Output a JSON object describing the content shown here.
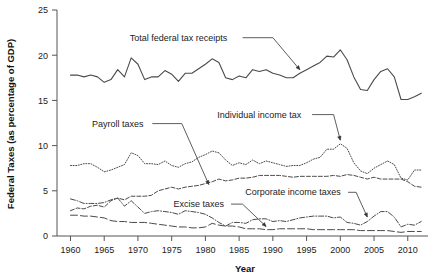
{
  "chart_data": {
    "type": "line",
    "title": "",
    "xlabel": "Year",
    "ylabel": "Federal Taxes (as percentage of GDP)",
    "xlim": [
      1958,
      2013
    ],
    "ylim": [
      0,
      25
    ],
    "xticks": [
      1960,
      1965,
      1970,
      1975,
      1980,
      1985,
      1990,
      1995,
      2000,
      2005,
      2010
    ],
    "yticks": [
      0,
      5,
      10,
      15,
      20,
      25
    ],
    "grid": false,
    "legend_position": "inline-annotations",
    "x": [
      1960,
      1961,
      1962,
      1963,
      1964,
      1965,
      1966,
      1967,
      1968,
      1969,
      1970,
      1971,
      1972,
      1973,
      1974,
      1975,
      1976,
      1977,
      1978,
      1979,
      1980,
      1981,
      1982,
      1983,
      1984,
      1985,
      1986,
      1987,
      1988,
      1989,
      1990,
      1991,
      1992,
      1993,
      1994,
      1995,
      1996,
      1997,
      1998,
      1999,
      2000,
      2001,
      2002,
      2003,
      2004,
      2005,
      2006,
      2007,
      2008,
      2009,
      2010,
      2011,
      2012
    ],
    "series": [
      {
        "name": "Total federal tax receipts",
        "style": "solid",
        "values": [
          17.8,
          17.8,
          17.6,
          17.8,
          17.6,
          17.0,
          17.3,
          18.4,
          17.6,
          19.7,
          19.0,
          17.3,
          17.6,
          17.6,
          18.3,
          17.9,
          17.1,
          18.0,
          18.0,
          18.5,
          19.0,
          19.6,
          19.2,
          17.5,
          17.3,
          17.7,
          17.5,
          18.4,
          18.2,
          18.4,
          18.0,
          17.8,
          17.5,
          17.5,
          18.0,
          18.4,
          18.8,
          19.2,
          19.9,
          19.8,
          20.6,
          19.5,
          17.6,
          16.2,
          16.1,
          17.3,
          18.2,
          18.5,
          17.6,
          15.1,
          15.1,
          15.4,
          15.8
        ]
      },
      {
        "name": "Individual income tax",
        "style": "dotted",
        "values": [
          7.8,
          7.8,
          8.0,
          8.0,
          7.6,
          7.1,
          7.3,
          7.6,
          7.9,
          9.2,
          8.9,
          8.0,
          8.0,
          7.9,
          8.3,
          7.8,
          7.6,
          8.0,
          8.2,
          8.7,
          9.0,
          9.4,
          9.2,
          8.4,
          7.8,
          8.1,
          7.9,
          8.4,
          8.0,
          8.3,
          8.1,
          7.9,
          7.7,
          7.8,
          7.8,
          8.1,
          8.5,
          8.7,
          9.6,
          9.6,
          10.2,
          9.7,
          8.1,
          7.2,
          6.9,
          7.5,
          7.9,
          8.3,
          7.9,
          6.4,
          6.2,
          7.3,
          7.3
        ]
      },
      {
        "name": "Payroll taxes",
        "style": "dashed",
        "values": [
          2.8,
          3.1,
          3.0,
          3.3,
          3.4,
          3.2,
          3.9,
          4.2,
          4.0,
          4.4,
          4.4,
          4.4,
          4.5,
          5.0,
          5.2,
          5.4,
          5.2,
          5.4,
          5.5,
          5.6,
          5.8,
          6.0,
          6.3,
          6.1,
          6.2,
          6.4,
          6.4,
          6.5,
          6.7,
          6.7,
          6.7,
          6.7,
          6.6,
          6.5,
          6.6,
          6.6,
          6.6,
          6.6,
          6.6,
          6.7,
          6.6,
          6.8,
          6.7,
          6.5,
          6.3,
          6.5,
          6.3,
          6.3,
          6.3,
          6.3,
          6.0,
          5.5,
          5.4
        ]
      },
      {
        "name": "Corporate income taxes",
        "style": "dash-dot",
        "values": [
          4.1,
          3.9,
          3.6,
          3.6,
          3.6,
          3.7,
          4.0,
          4.2,
          3.3,
          3.9,
          3.2,
          2.5,
          2.7,
          2.8,
          2.7,
          2.6,
          2.4,
          2.8,
          2.7,
          2.6,
          2.4,
          2.0,
          1.5,
          1.1,
          1.5,
          1.5,
          1.4,
          1.8,
          1.9,
          1.9,
          1.6,
          1.7,
          1.6,
          1.8,
          2.0,
          2.1,
          2.2,
          2.2,
          2.2,
          2.0,
          2.1,
          1.5,
          1.4,
          1.2,
          1.6,
          2.2,
          2.7,
          2.7,
          2.1,
          1.0,
          1.3,
          1.2,
          1.6
        ]
      },
      {
        "name": "Excise taxes",
        "style": "long-dash",
        "values": [
          2.3,
          2.3,
          2.2,
          2.2,
          2.1,
          2.0,
          1.7,
          1.6,
          1.6,
          1.5,
          1.5,
          1.5,
          1.4,
          1.3,
          1.2,
          1.1,
          1.0,
          1.0,
          0.9,
          0.9,
          1.0,
          1.4,
          1.2,
          1.1,
          1.1,
          1.0,
          0.8,
          0.8,
          0.8,
          0.7,
          0.7,
          0.8,
          0.8,
          0.8,
          0.8,
          0.8,
          0.7,
          0.7,
          0.7,
          0.7,
          0.7,
          0.7,
          0.7,
          0.6,
          0.6,
          0.6,
          0.6,
          0.6,
          0.5,
          0.4,
          0.5,
          0.5,
          0.5
        ]
      }
    ],
    "annotations": [
      {
        "label": "Total federal tax receipts",
        "x": 1976,
        "y": 21.6
      },
      {
        "label": "Individual income tax",
        "x": 1988,
        "y": 13.1
      },
      {
        "label": "Payroll taxes",
        "x": 1967,
        "y": 12.1
      },
      {
        "label": "Corporate income taxes",
        "x": 1993,
        "y": 4.5
      },
      {
        "label": "Excise taxes",
        "x": 1979,
        "y": 3.2
      }
    ]
  }
}
